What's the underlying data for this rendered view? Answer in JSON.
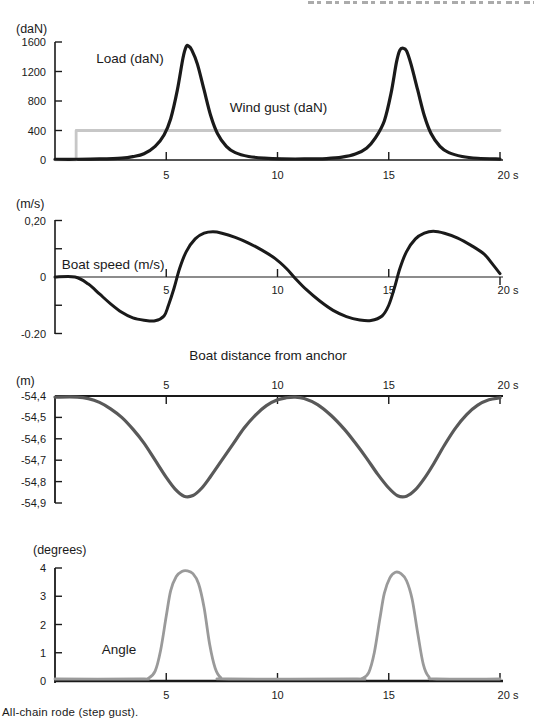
{
  "page": {
    "caption": "All-chain rode (step gust)."
  },
  "colors": {
    "black": "#1a1a1a",
    "gust_gray": "#c7c7c7",
    "distance_gray": "#595959",
    "angle_gray": "#9a9a9a"
  },
  "chart_data": [
    {
      "id": "load",
      "type": "line",
      "unit_label": "(daN)",
      "x": {
        "range": [
          0,
          20
        ],
        "ticks": [
          {
            "v": 5,
            "label": "5"
          },
          {
            "v": 10,
            "label": "10"
          },
          {
            "v": 15,
            "label": "15"
          },
          {
            "v": 20,
            "label": "20 s"
          }
        ]
      },
      "y": {
        "range": [
          0,
          1600
        ],
        "ticks": [
          {
            "v": 0,
            "label": "0"
          },
          {
            "v": 400,
            "label": "400"
          },
          {
            "v": 800,
            "label": "800"
          },
          {
            "v": 1200,
            "label": "1200"
          },
          {
            "v": 1600,
            "label": "1600"
          }
        ]
      },
      "annotations": [
        {
          "text": "Load (daN)",
          "t": 1.85,
          "v": 1315,
          "anchor": "start"
        },
        {
          "text": "Wind gust (daN)",
          "t": 7.85,
          "v": 650,
          "anchor": "start"
        }
      ],
      "series": [
        {
          "name": "wind-gust",
          "color": "#c7c7c7",
          "stroke_width": 2.8,
          "smooth": false,
          "points": [
            [
              0,
              2
            ],
            [
              0.95,
              2
            ],
            [
              0.95,
              400
            ],
            [
              20,
              400
            ]
          ]
        },
        {
          "name": "load",
          "color": "#1a1a1a",
          "stroke_width": 3.2,
          "smooth": true,
          "points": [
            [
              0,
              10
            ],
            [
              1,
              10
            ],
            [
              2,
              14
            ],
            [
              3,
              26
            ],
            [
              3.5,
              46
            ],
            [
              4,
              85
            ],
            [
              4.5,
              185
            ],
            [
              4.9,
              340
            ],
            [
              5.2,
              560
            ],
            [
              5.5,
              950
            ],
            [
              5.75,
              1380
            ],
            [
              5.9,
              1540
            ],
            [
              6.0,
              1545
            ],
            [
              6.15,
              1490
            ],
            [
              6.4,
              1300
            ],
            [
              6.7,
              950
            ],
            [
              7.0,
              600
            ],
            [
              7.3,
              360
            ],
            [
              7.7,
              185
            ],
            [
              8.1,
              100
            ],
            [
              8.7,
              48
            ],
            [
              9.4,
              25
            ],
            [
              10.2,
              15
            ],
            [
              11.2,
              14
            ],
            [
              12.2,
              20
            ],
            [
              12.9,
              38
            ],
            [
              13.5,
              80
            ],
            [
              14.0,
              160
            ],
            [
              14.4,
              300
            ],
            [
              14.8,
              530
            ],
            [
              15.1,
              900
            ],
            [
              15.35,
              1330
            ],
            [
              15.5,
              1490
            ],
            [
              15.65,
              1515
            ],
            [
              15.8,
              1480
            ],
            [
              16.0,
              1300
            ],
            [
              16.3,
              950
            ],
            [
              16.6,
              600
            ],
            [
              16.9,
              360
            ],
            [
              17.3,
              185
            ],
            [
              17.7,
              100
            ],
            [
              18.3,
              48
            ],
            [
              19.0,
              24
            ],
            [
              20,
              13
            ]
          ]
        }
      ]
    },
    {
      "id": "speed",
      "type": "line",
      "unit_label": "(m/s)",
      "x": {
        "range": [
          0,
          20
        ],
        "ticks": [
          {
            "v": 5,
            "label": "5"
          },
          {
            "v": 10,
            "label": "10"
          },
          {
            "v": 15,
            "label": "15"
          },
          {
            "v": 20,
            "label": "20 s"
          }
        ]
      },
      "y": {
        "range": [
          -0.2,
          0.2
        ],
        "ticks": [
          {
            "v": 0.2,
            "label": "0,20"
          },
          {
            "v": 0.1,
            "label": ""
          },
          {
            "v": 0,
            "label": "0"
          },
          {
            "v": -0.1,
            "label": ""
          },
          {
            "v": -0.2,
            "label": "-0.20"
          }
        ]
      },
      "annotations": [
        {
          "text": "Boat speed (m/s)",
          "t": 0.3,
          "v": 0.028,
          "anchor": "start"
        }
      ],
      "series": [
        {
          "name": "boat-speed",
          "color": "#1a1a1a",
          "stroke_width": 3,
          "smooth": true,
          "points": [
            [
              0,
              0
            ],
            [
              0.9,
              0
            ],
            [
              1.5,
              -0.025
            ],
            [
              2,
              -0.06
            ],
            [
              2.5,
              -0.095
            ],
            [
              3,
              -0.125
            ],
            [
              3.5,
              -0.145
            ],
            [
              4,
              -0.153
            ],
            [
              4.5,
              -0.155
            ],
            [
              4.9,
              -0.138
            ],
            [
              5.1,
              -0.1
            ],
            [
              5.35,
              -0.04
            ],
            [
              5.6,
              0.03
            ],
            [
              5.9,
              0.09
            ],
            [
              6.3,
              0.135
            ],
            [
              6.7,
              0.155
            ],
            [
              7.1,
              0.16
            ],
            [
              7.5,
              0.155
            ],
            [
              8.1,
              0.14
            ],
            [
              8.7,
              0.12
            ],
            [
              9.3,
              0.095
            ],
            [
              9.9,
              0.065
            ],
            [
              10.4,
              0.03
            ],
            [
              10.8,
              -0.005
            ],
            [
              11.3,
              -0.045
            ],
            [
              11.9,
              -0.085
            ],
            [
              12.5,
              -0.118
            ],
            [
              13.1,
              -0.14
            ],
            [
              13.7,
              -0.152
            ],
            [
              14.2,
              -0.154
            ],
            [
              14.7,
              -0.138
            ],
            [
              15.0,
              -0.1
            ],
            [
              15.25,
              -0.04
            ],
            [
              15.5,
              0.03
            ],
            [
              15.8,
              0.09
            ],
            [
              16.2,
              0.135
            ],
            [
              16.6,
              0.155
            ],
            [
              17.0,
              0.162
            ],
            [
              17.5,
              0.155
            ],
            [
              18.1,
              0.138
            ],
            [
              18.7,
              0.112
            ],
            [
              19.3,
              0.08
            ],
            [
              19.7,
              0.042
            ],
            [
              20,
              0.012
            ]
          ]
        }
      ]
    },
    {
      "id": "distance",
      "type": "line",
      "title": "Boat distance from anchor",
      "unit_label": "(m)",
      "x": {
        "range": [
          0,
          20
        ],
        "axis_position": "top",
        "ticks": [
          {
            "v": 5,
            "label": "5"
          },
          {
            "v": 10,
            "label": "10"
          },
          {
            "v": 15,
            "label": "15"
          },
          {
            "v": 20,
            "label": "20 s"
          }
        ]
      },
      "y": {
        "range": [
          -54.9,
          -54.4
        ],
        "ticks": [
          {
            "v": -54.4,
            "label": "-54,4"
          },
          {
            "v": -54.5,
            "label": "-54,5"
          },
          {
            "v": -54.6,
            "label": "-54,6"
          },
          {
            "v": -54.7,
            "label": "-54,7"
          },
          {
            "v": -54.8,
            "label": "-54,8"
          },
          {
            "v": -54.9,
            "label": "-54,9"
          }
        ]
      },
      "annotations": [],
      "series": [
        {
          "name": "boat-distance",
          "color": "#595959",
          "stroke_width": 3.2,
          "smooth": true,
          "points": [
            [
              0,
              -54.405
            ],
            [
              1,
              -54.405
            ],
            [
              1.5,
              -54.412
            ],
            [
              2,
              -54.43
            ],
            [
              2.5,
              -54.46
            ],
            [
              3,
              -54.5
            ],
            [
              3.5,
              -54.555
            ],
            [
              4,
              -54.62
            ],
            [
              4.5,
              -54.7
            ],
            [
              5,
              -54.78
            ],
            [
              5.4,
              -54.835
            ],
            [
              5.8,
              -54.868
            ],
            [
              6.2,
              -54.865
            ],
            [
              6.6,
              -54.83
            ],
            [
              7,
              -54.775
            ],
            [
              7.5,
              -54.7
            ],
            [
              8,
              -54.625
            ],
            [
              8.5,
              -54.55
            ],
            [
              9,
              -54.49
            ],
            [
              9.5,
              -54.445
            ],
            [
              10,
              -54.418
            ],
            [
              10.4,
              -54.408
            ],
            [
              10.8,
              -54.405
            ],
            [
              11.2,
              -54.412
            ],
            [
              11.8,
              -54.44
            ],
            [
              12.4,
              -54.49
            ],
            [
              13,
              -54.555
            ],
            [
              13.5,
              -54.62
            ],
            [
              14,
              -54.69
            ],
            [
              14.5,
              -54.765
            ],
            [
              15,
              -54.83
            ],
            [
              15.4,
              -54.866
            ],
            [
              15.8,
              -54.868
            ],
            [
              16.2,
              -54.838
            ],
            [
              16.6,
              -54.785
            ],
            [
              17,
              -54.72
            ],
            [
              17.5,
              -54.63
            ],
            [
              18,
              -54.55
            ],
            [
              18.5,
              -54.487
            ],
            [
              19,
              -54.443
            ],
            [
              19.5,
              -54.418
            ],
            [
              20,
              -54.408
            ]
          ]
        }
      ]
    },
    {
      "id": "angle",
      "type": "line",
      "unit_label": "(degrees)",
      "x": {
        "range": [
          0,
          20
        ],
        "ticks": [
          {
            "v": 5,
            "label": "5"
          },
          {
            "v": 10,
            "label": "10"
          },
          {
            "v": 15,
            "label": "15"
          },
          {
            "v": 20,
            "label": "20 s"
          }
        ]
      },
      "y": {
        "range": [
          0,
          4
        ],
        "ticks": [
          {
            "v": 0,
            "label": "0"
          },
          {
            "v": 1,
            "label": "1"
          },
          {
            "v": 2,
            "label": "2"
          },
          {
            "v": 3,
            "label": "3"
          },
          {
            "v": 4,
            "label": "4"
          }
        ]
      },
      "annotations": [
        {
          "text": "Angle",
          "t": 2.1,
          "v": 0.95,
          "anchor": "start"
        }
      ],
      "series": [
        {
          "name": "angle",
          "color": "#9a9a9a",
          "stroke_width": 2.8,
          "smooth": true,
          "points": [
            [
              0,
              0.07
            ],
            [
              3.8,
              0.07
            ],
            [
              4.2,
              0.1
            ],
            [
              4.5,
              0.35
            ],
            [
              4.75,
              1.1
            ],
            [
              5,
              2.3
            ],
            [
              5.2,
              3.2
            ],
            [
              5.45,
              3.7
            ],
            [
              5.7,
              3.88
            ],
            [
              5.95,
              3.9
            ],
            [
              6.2,
              3.8
            ],
            [
              6.45,
              3.45
            ],
            [
              6.7,
              2.6
            ],
            [
              6.95,
              1.3
            ],
            [
              7.2,
              0.45
            ],
            [
              7.45,
              0.12
            ],
            [
              7.8,
              0.07
            ],
            [
              13.4,
              0.07
            ],
            [
              13.8,
              0.09
            ],
            [
              14.1,
              0.3
            ],
            [
              14.35,
              1.0
            ],
            [
              14.6,
              2.2
            ],
            [
              14.8,
              3.1
            ],
            [
              15.05,
              3.65
            ],
            [
              15.3,
              3.85
            ],
            [
              15.55,
              3.8
            ],
            [
              15.8,
              3.55
            ],
            [
              16.05,
              2.9
            ],
            [
              16.3,
              1.7
            ],
            [
              16.55,
              0.6
            ],
            [
              16.8,
              0.15
            ],
            [
              17.15,
              0.07
            ],
            [
              20,
              0.07
            ]
          ]
        }
      ]
    }
  ]
}
